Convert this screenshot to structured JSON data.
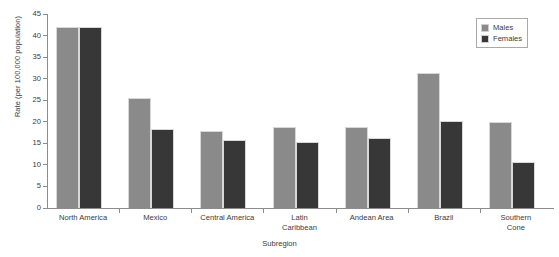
{
  "chart_data": {
    "type": "bar",
    "title": "",
    "xlabel": "Subregion",
    "ylabel": "Rate (per 100,000 population)",
    "ylim": [
      0,
      45
    ],
    "ytick_step": 5,
    "yticks": [
      45,
      40,
      35,
      30,
      25,
      20,
      15,
      10,
      5,
      0
    ],
    "grid": false,
    "legend_position": "top-right",
    "categories": [
      "North America",
      "Mexico",
      "Central America",
      "Latin Caribbean",
      "Andean Area",
      "Brazil",
      "Southern Cone"
    ],
    "category_lines": [
      [
        "North America"
      ],
      [
        "Mexico"
      ],
      [
        "Central America"
      ],
      [
        "Latin",
        "Caribbean"
      ],
      [
        "Andean Area"
      ],
      [
        "Brazil"
      ],
      [
        "Southern",
        "Cone"
      ]
    ],
    "series": [
      {
        "name": "Males",
        "color": "#8a8a8a",
        "values": [
          42.0,
          25.5,
          17.8,
          18.8,
          18.8,
          31.3,
          20.0
        ]
      },
      {
        "name": "Females",
        "color": "#373737",
        "values": [
          42.0,
          18.3,
          15.8,
          15.4,
          16.3,
          20.3,
          10.6
        ]
      }
    ]
  },
  "legend": {
    "items": [
      {
        "label": "Males",
        "swatch": "males"
      },
      {
        "label": "Females",
        "swatch": "females"
      }
    ]
  },
  "footer": {
    "caption": ""
  }
}
